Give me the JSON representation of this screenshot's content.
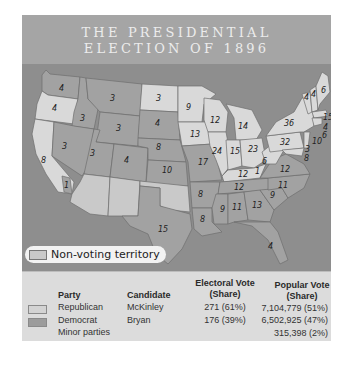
{
  "title": {
    "line1": "THE PRESIDENTIAL",
    "line2": "ELECTION OF 1896"
  },
  "colors": {
    "republican": "#d9d9d9",
    "democrat": "#a2a2a2",
    "non_voting": "#c9c9c9",
    "water": "#8e8e8e",
    "title_band": "#a5a5a5",
    "table_bg": "#dcdcdc"
  },
  "legend": {
    "non_voting_label": "Non-voting territory"
  },
  "map": {
    "states": [
      {
        "name": "WA",
        "ev": "4",
        "party": "democrat"
      },
      {
        "name": "OR",
        "ev": "4",
        "party": "republican"
      },
      {
        "name": "CA",
        "ev": "8",
        "party": "republican"
      },
      {
        "name": "CA-split",
        "ev": "1",
        "party": "democrat"
      },
      {
        "name": "ID",
        "ev": "3",
        "party": "democrat"
      },
      {
        "name": "NV",
        "ev": "3",
        "party": "democrat"
      },
      {
        "name": "MT",
        "ev": "3",
        "party": "democrat"
      },
      {
        "name": "WY",
        "ev": "3",
        "party": "democrat"
      },
      {
        "name": "UT",
        "ev": "3",
        "party": "democrat"
      },
      {
        "name": "CO",
        "ev": "4",
        "party": "democrat"
      },
      {
        "name": "ND",
        "ev": "3",
        "party": "republican"
      },
      {
        "name": "SD",
        "ev": "4",
        "party": "democrat"
      },
      {
        "name": "NE",
        "ev": "8",
        "party": "democrat"
      },
      {
        "name": "KS",
        "ev": "10",
        "party": "democrat"
      },
      {
        "name": "TX",
        "ev": "15",
        "party": "democrat"
      },
      {
        "name": "MN",
        "ev": "9",
        "party": "republican"
      },
      {
        "name": "IA",
        "ev": "13",
        "party": "republican"
      },
      {
        "name": "MO",
        "ev": "17",
        "party": "democrat"
      },
      {
        "name": "AR",
        "ev": "8",
        "party": "democrat"
      },
      {
        "name": "LA",
        "ev": "8",
        "party": "democrat"
      },
      {
        "name": "WI",
        "ev": "12",
        "party": "republican"
      },
      {
        "name": "IL",
        "ev": "24",
        "party": "republican"
      },
      {
        "name": "MI",
        "ev": "14",
        "party": "republican"
      },
      {
        "name": "IN",
        "ev": "15",
        "party": "republican"
      },
      {
        "name": "OH",
        "ev": "23",
        "party": "republican"
      },
      {
        "name": "KY",
        "ev": "12",
        "party": "republican"
      },
      {
        "name": "KY-split",
        "ev": "1",
        "party": "democrat"
      },
      {
        "name": "TN",
        "ev": "12",
        "party": "democrat"
      },
      {
        "name": "MS",
        "ev": "9",
        "party": "democrat"
      },
      {
        "name": "AL",
        "ev": "11",
        "party": "democrat"
      },
      {
        "name": "GA",
        "ev": "13",
        "party": "democrat"
      },
      {
        "name": "FL",
        "ev": "4",
        "party": "democrat"
      },
      {
        "name": "SC",
        "ev": "9",
        "party": "democrat"
      },
      {
        "name": "NC",
        "ev": "11",
        "party": "democrat"
      },
      {
        "name": "VA",
        "ev": "12",
        "party": "democrat"
      },
      {
        "name": "WV",
        "ev": "6",
        "party": "republican"
      },
      {
        "name": "PA",
        "ev": "32",
        "party": "republican"
      },
      {
        "name": "NY",
        "ev": "36",
        "party": "republican"
      },
      {
        "name": "VT",
        "ev": "4",
        "party": "republican"
      },
      {
        "name": "NH",
        "ev": "4",
        "party": "republican"
      },
      {
        "name": "ME",
        "ev": "6",
        "party": "republican"
      },
      {
        "name": "MA",
        "ev": "15",
        "party": "republican"
      },
      {
        "name": "RI",
        "ev": "4",
        "party": "republican"
      },
      {
        "name": "CT",
        "ev": "6",
        "party": "republican"
      },
      {
        "name": "NJ",
        "ev": "10",
        "party": "republican"
      },
      {
        "name": "DE",
        "ev": "3",
        "party": "republican"
      },
      {
        "name": "MD",
        "ev": "8",
        "party": "republican"
      }
    ]
  },
  "table": {
    "headers": {
      "party": "Party",
      "candidate": "Candidate",
      "electoral_l1": "Electoral Vote",
      "electoral_l2": "(Share)",
      "popular_l1": "Popular Vote",
      "popular_l2": "(Share)"
    },
    "rows": [
      {
        "party": "Republican",
        "candidate": "McKinley",
        "electoral": "271 (61%)",
        "popular": "7,104,779 (51%)"
      },
      {
        "party": "Democrat",
        "candidate": "Bryan",
        "electoral": "176 (39%)",
        "popular": "6,502,925 (47%)"
      },
      {
        "party": "Minor parties",
        "candidate": "",
        "electoral": "",
        "popular": "315,398 (2%)"
      }
    ]
  }
}
